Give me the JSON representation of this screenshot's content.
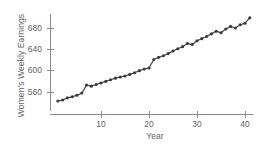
{
  "chart_data": {
    "type": "line",
    "title": "",
    "xlabel": "Year",
    "ylabel": "Women's Weekly Earnings",
    "xlim": [
      0,
      42.5
    ],
    "ylim": [
      533,
      706
    ],
    "grid": false,
    "legend": false,
    "marker": "filled-circle",
    "line_color": "#4c4c4e",
    "marker_color": "#3a3a3c",
    "axis_color": "#8a8b8d",
    "xticks": [
      10,
      20,
      30,
      40
    ],
    "yticks": [
      560,
      600,
      640,
      680
    ],
    "xtick_labels": [
      "10",
      "20",
      "30",
      "40"
    ],
    "ytick_labels": [
      "560",
      "600",
      "640",
      "680"
    ],
    "x": [
      1,
      2,
      3,
      4,
      5,
      6,
      7,
      8,
      9,
      10,
      11,
      12,
      13,
      14,
      15,
      16,
      17,
      18,
      19,
      20,
      21,
      22,
      23,
      24,
      25,
      26,
      27,
      28,
      29,
      30,
      31,
      32,
      33,
      34,
      35,
      36,
      37,
      38,
      39,
      40,
      41
    ],
    "values": [
      543,
      545,
      549,
      551,
      554,
      558,
      573,
      571,
      574,
      577,
      580,
      583,
      586,
      588,
      590,
      593,
      596,
      600,
      603,
      605,
      621,
      625,
      628,
      632,
      637,
      641,
      645,
      651,
      649,
      656,
      660,
      664,
      669,
      674,
      671,
      678,
      683,
      680,
      686,
      689,
      699
    ]
  }
}
